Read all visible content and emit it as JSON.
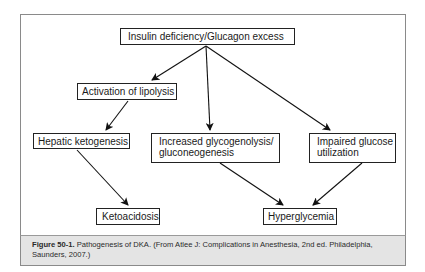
{
  "diagram": {
    "nodes": {
      "root": "Insulin deficiency/Glucagon excess",
      "lipolysis": "Activation of lipolysis",
      "ketogenesis": "Hepatic ketogenesis",
      "glycogenolysis_line1": "Increased glycogenolysis/",
      "glycogenolysis_line2": "gluconeogenesis",
      "impaired_line1": "Impaired glucose",
      "impaired_line2": "utilization",
      "ketoacidosis": "Ketoacidosis",
      "hyperglycemia": "Hyperglycemia"
    },
    "edges": [
      {
        "from": "root",
        "to": "lipolysis"
      },
      {
        "from": "root",
        "to": "glycogenolysis"
      },
      {
        "from": "root",
        "to": "impaired"
      },
      {
        "from": "lipolysis",
        "to": "ketogenesis"
      },
      {
        "from": "ketogenesis",
        "to": "ketoacidosis"
      },
      {
        "from": "glycogenolysis",
        "to": "hyperglycemia"
      },
      {
        "from": "impaired",
        "to": "hyperglycemia"
      }
    ]
  },
  "caption": {
    "label": "Figure 50-1.",
    "text": " Pathogenesis of DKA.  (From Atlee J: Complications in Anesthesia, 2nd ed. Philadelphia, Saunders, 2007.)"
  }
}
